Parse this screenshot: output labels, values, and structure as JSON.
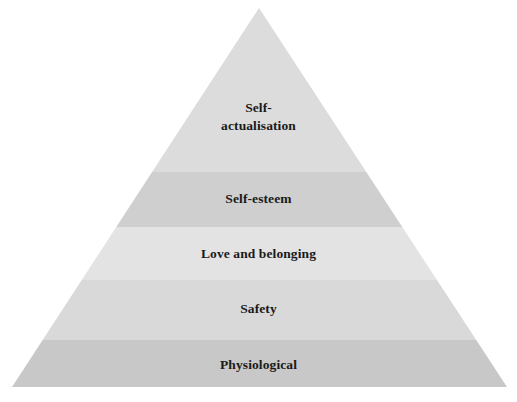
{
  "diagram": {
    "type": "pyramid",
    "background_color": "#ffffff",
    "text_color": "#1a1a1a",
    "apex": {
      "x": 259,
      "y": 8
    },
    "base_left": {
      "x": 12,
      "y": 387
    },
    "base_right": {
      "x": 507,
      "y": 387
    },
    "band_boundaries_y": [
      8,
      172,
      227,
      280,
      340,
      387
    ],
    "tiers": [
      {
        "rank": 5,
        "label": "Self-\nactualisation",
        "label_plain": "Self-actualisation",
        "color": "#dcdcdc",
        "top_y": 8,
        "bottom_y": 172
      },
      {
        "rank": 4,
        "label": "Self-esteem",
        "label_plain": "Self-esteem",
        "color": "#cfcfcf",
        "top_y": 172,
        "bottom_y": 227
      },
      {
        "rank": 3,
        "label": "Love and belonging",
        "label_plain": "Love and belonging",
        "color": "#e3e3e3",
        "top_y": 227,
        "bottom_y": 280
      },
      {
        "rank": 2,
        "label": "Safety",
        "label_plain": "Safety",
        "color": "#d9d9d9",
        "top_y": 280,
        "bottom_y": 340
      },
      {
        "rank": 1,
        "label": "Physiological",
        "label_plain": "Physiological",
        "color": "#c8c8c8",
        "top_y": 340,
        "bottom_y": 387
      }
    ]
  }
}
